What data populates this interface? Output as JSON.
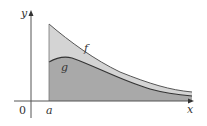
{
  "diagram": {
    "type": "area comparison of two functions",
    "labels": {
      "y_axis": "y",
      "x_axis": "x",
      "origin": "0",
      "a_mark": "a",
      "f_curve": "f",
      "g_curve": "g"
    },
    "colors": {
      "background": "#ffffff",
      "axis": "#555555",
      "region_between_f_g": "#d4d4d4",
      "region_under_g": "#a9a9a9",
      "curve_f": "#555555",
      "curve_g": "#333333"
    }
  }
}
